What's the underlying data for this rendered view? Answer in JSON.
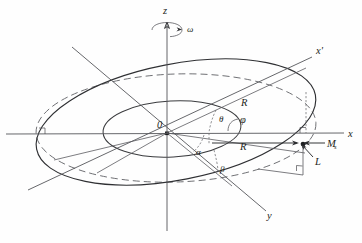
{
  "figure": {
    "background_color": "#fefefe",
    "line_color": "#2f3033",
    "dashed_color": "#6a6b6f"
  },
  "axes": [
    {
      "id": "z",
      "label": "z",
      "description": "vertical axis, upward"
    },
    {
      "id": "x",
      "label": "x",
      "description": "horizontal axis, to the right"
    },
    {
      "id": "y",
      "label": "y",
      "description": "depth axis, toward lower right"
    },
    {
      "id": "xprime",
      "label": "x'",
      "description": "tilted primed axis, toward upper right"
    }
  ],
  "angles": [
    {
      "id": "theta",
      "label": "θ",
      "description": "angle between x' projection and x axis in upper region"
    },
    {
      "id": "phi",
      "label": "φ",
      "description": "azimuthal angle marked with leader line at right of center"
    },
    {
      "id": "alpha",
      "label": "α",
      "description": "angle below the x axis near the origin"
    },
    {
      "id": "beta",
      "label": "β",
      "description": "angle between R vector and y direction, lower region"
    }
  ],
  "vectors": [
    {
      "id": "omega",
      "label": "ω",
      "description": "angular velocity about the z axis, curved rotation arrow"
    },
    {
      "id": "R_upper",
      "label": "R",
      "description": "radius along the x' axis in the upper half"
    },
    {
      "id": "R_lower",
      "label": "R",
      "description": "radius vector along horizontal direction toward the rim point"
    },
    {
      "id": "Ms",
      "label": "M",
      "sub": "s",
      "description": "saturation magnetization vector pointing left at the rim point"
    },
    {
      "id": "L",
      "label": "L",
      "description": "angular momentum vector at the rim point, pointing down-left"
    }
  ],
  "points": [
    {
      "id": "origin",
      "label": "0",
      "description": "origin of the coordinate system"
    }
  ],
  "curves": [
    {
      "id": "tilted-ring-outer",
      "style": "solid",
      "description": "large tilted ellipse representing the inclined ring"
    },
    {
      "id": "horizontal-ring",
      "style": "dashed",
      "description": "dashed ellipse representing the horizontal projection plane circle"
    },
    {
      "id": "inner-ring",
      "style": "solid",
      "description": "small inner ellipse around the origin"
    }
  ],
  "markers": [
    {
      "id": "right-angle-upper",
      "description": "right angle square mark where the vertical drop meets the x axis"
    },
    {
      "id": "right-angle-lower",
      "description": "right angle square mark on the lower rim projection"
    }
  ]
}
